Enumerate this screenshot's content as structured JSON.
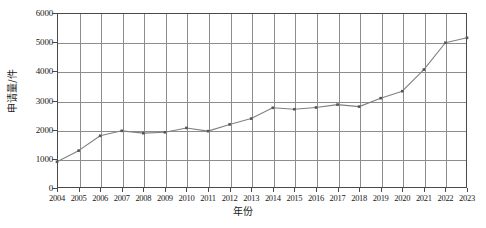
{
  "chart_data": {
    "type": "line",
    "title": "",
    "xlabel": "年份",
    "ylabel": "申请量/件",
    "categories": [
      "2004",
      "2005",
      "2006",
      "2007",
      "2008",
      "2009",
      "2010",
      "2011",
      "2012",
      "2013",
      "2014",
      "2015",
      "2016",
      "2017",
      "2018",
      "2019",
      "2020",
      "2021",
      "2022",
      "2023"
    ],
    "values": [
      900,
      1280,
      1790,
      1960,
      1880,
      1910,
      2060,
      1950,
      2180,
      2380,
      2750,
      2700,
      2760,
      2860,
      2790,
      3080,
      3320,
      4060,
      4980,
      5150
    ],
    "series": [
      {
        "name": "申请量",
        "values": [
          900,
          1280,
          1790,
          1960,
          1880,
          1910,
          2060,
          1950,
          2180,
          2380,
          2750,
          2700,
          2760,
          2860,
          2790,
          3080,
          3320,
          4060,
          4980,
          5150
        ]
      }
    ],
    "ylim": [
      0,
      6000
    ],
    "yticks": [
      0,
      1000,
      2000,
      3000,
      4000,
      5000,
      6000
    ],
    "ytick_labels": [
      "0",
      "1000",
      "2000",
      "3000",
      "4000",
      "5000",
      "6000"
    ],
    "grid": true,
    "legend": false,
    "legend_position": "none",
    "marker": "square",
    "line_color": "#808080",
    "marker_color": "#555555",
    "grid_color": "#8d8d8d",
    "axis_color": "#4a4a4a"
  }
}
